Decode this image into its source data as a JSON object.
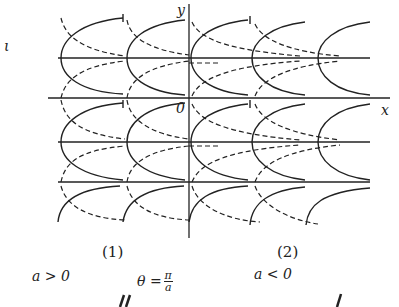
{
  "labels": {
    "y_axis": "y",
    "x_axis": "x",
    "origin": "0",
    "left_margin": "ι",
    "panel1": "(1)",
    "panel2": "(2)",
    "cond1": "a > 0",
    "cond2": "a < 0",
    "theta_lhs": "θ =",
    "theta_num": "π",
    "theta_den": "a"
  },
  "colors": {
    "ink": "#222222",
    "background": "#ffffff"
  }
}
